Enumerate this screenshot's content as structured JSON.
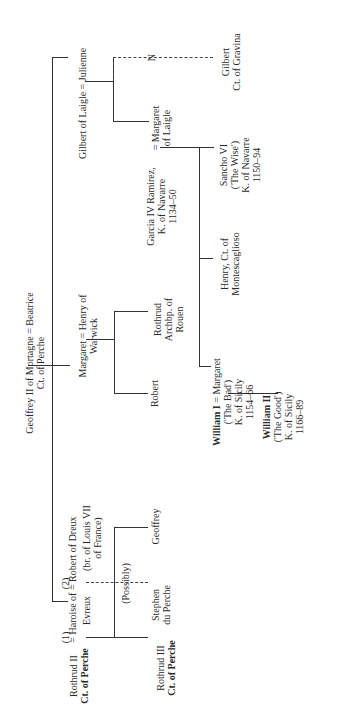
{
  "persons": {
    "geoffrey_ii": {
      "line1": "Geoffrey II of Mortagne = Beatrice",
      "line2": "Ct. of Perche"
    },
    "gilbert_laigle": {
      "line1": "Gilbert of Laigle = Julienne"
    },
    "gilbert_gravina": {
      "line1": "Gilbert",
      "line2": "Ct. of Gravina"
    },
    "n_marker": "N",
    "margaret_laigle": {
      "line1": "= Margaret",
      "line2": "of Laigle"
    },
    "garcia_iv": {
      "line1": "Garcia IV Ramirez,",
      "line2": "K. of Navarre",
      "line3": "1134–50"
    },
    "sancho_vi": {
      "line1": "Sancho VI",
      "line2": "('The Wise')",
      "line3": "K. of Navarre",
      "line4": "1150–94"
    },
    "henry_montescaglioso": {
      "line1": "Henry, Ct. of",
      "line2": "Montescaglioso"
    },
    "margaret_warwick": {
      "line1": "Margaret = Henry of",
      "line2": "Warwick"
    },
    "rothrud_archbp": {
      "line1": "Rothrud",
      "line2": "Archbp. of",
      "line3": "Rouen"
    },
    "robert": {
      "line1": "Robert"
    },
    "william_i": {
      "line1_bold": "William I",
      "line1_rest": " = Margaret",
      "line2": "('The Bad')",
      "line3": "K. of Sicily",
      "line4": "1154–66"
    },
    "william_ii": {
      "line1": "William II",
      "line2": "('The Good')",
      "line3": "K. of Sicily",
      "line4": "1166–89"
    },
    "rothrud_ii": {
      "line1": "Rothrud II",
      "line2": "Ct. of Perche"
    },
    "haroise": {
      "marker1": "(1)",
      "marker2": "(2)",
      "line1": "= Haroise of = Robert of Dreux",
      "line2": "Evreux",
      "line2b": "(br. of Louis VII",
      "line3": "of France)"
    },
    "possibly": "(Possibly)",
    "rothrud_iii": {
      "line1": "Rothrud III",
      "line2": "Ct. of Perche"
    },
    "stephen": {
      "line1": "Stephen",
      "line2": "du Perche"
    },
    "geoffrey": {
      "line1": "Geoffrey"
    }
  }
}
